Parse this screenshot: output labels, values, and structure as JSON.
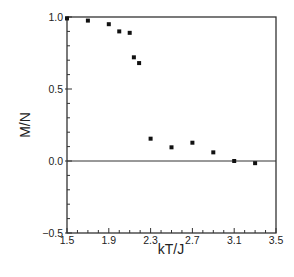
{
  "chart_data": {
    "type": "scatter",
    "title": "",
    "xlabel": "kT/J",
    "ylabel": "M/N",
    "xlim": [
      1.5,
      3.5
    ],
    "ylim": [
      -0.5,
      1.0
    ],
    "x_ticks": [
      1.5,
      1.9,
      2.3,
      2.7,
      3.1,
      3.5
    ],
    "x_tick_labels": [
      "1.5",
      "1.9",
      "2.3",
      "2.7",
      "3.1",
      "3.5"
    ],
    "x_minor_step": 0.1,
    "y_ticks": [
      -0.5,
      0.0,
      0.5,
      1.0
    ],
    "y_tick_labels": [
      "-0.5",
      "0.0",
      "0.5",
      "1.0"
    ],
    "y_minor_step": 0.1,
    "grid": false,
    "legend": null,
    "reference_lines": [
      {
        "axis": "y",
        "value": 0.0
      }
    ],
    "series": [
      {
        "name": "M/N",
        "marker": "square",
        "color": "#111111",
        "x": [
          1.5,
          1.7,
          1.9,
          2.0,
          2.1,
          2.14,
          2.19,
          2.3,
          2.5,
          2.7,
          2.9,
          3.1,
          3.3
        ],
        "y": [
          0.99,
          0.975,
          0.95,
          0.9,
          0.89,
          0.72,
          0.68,
          0.155,
          0.095,
          0.127,
          0.06,
          0.0,
          -0.015
        ]
      }
    ]
  },
  "colors": {
    "axis": "#333333",
    "marker": "#111111",
    "background": "#ffffff"
  }
}
